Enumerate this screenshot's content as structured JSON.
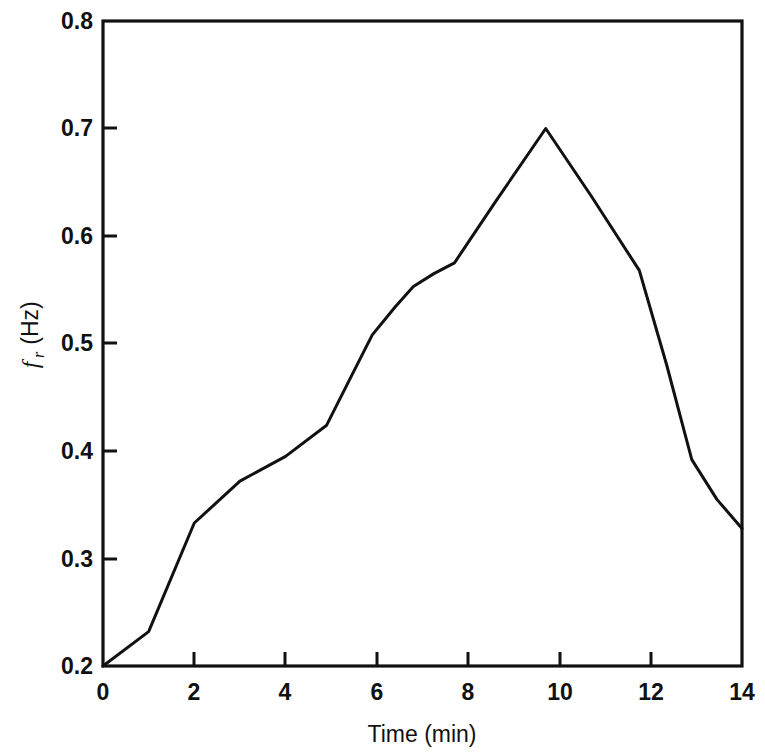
{
  "chart_data": {
    "type": "line",
    "title": "",
    "xlabel": "Time (min)",
    "ylabel": "f_r (Hz)",
    "ylabel_symbol": "f",
    "ylabel_subscript": "r",
    "ylabel_units": "(Hz)",
    "xlim": [
      0,
      14
    ],
    "ylim": [
      0.2,
      0.8
    ],
    "xticks": [
      0,
      2,
      4,
      6,
      8,
      10,
      12,
      14
    ],
    "xticklabels": [
      "0",
      "2",
      "4",
      "6",
      "8",
      "10",
      "12",
      "14"
    ],
    "yticks": [
      0.2,
      0.3,
      0.4,
      0.5,
      0.6,
      0.7,
      0.8
    ],
    "yticklabels": [
      "0.2",
      "0.3",
      "0.4",
      "0.5",
      "0.6",
      "0.7",
      "0.8"
    ],
    "grid": false,
    "legend": false,
    "legend_position": "none",
    "tick_direction": "in",
    "line_color": "#111111",
    "background_color": "#ffffff",
    "series": [
      {
        "name": "fr",
        "x": [
          0.0,
          1.0,
          2.0,
          3.0,
          4.0,
          4.9,
          5.35,
          5.9,
          6.4,
          6.8,
          7.25,
          7.7,
          8.6,
          9.7,
          10.7,
          11.75,
          12.35,
          12.9,
          13.45,
          14.0
        ],
        "y": [
          0.2,
          0.232,
          0.333,
          0.372,
          0.395,
          0.424,
          0.462,
          0.508,
          0.534,
          0.553,
          0.565,
          0.575,
          0.632,
          0.7,
          0.637,
          0.568,
          0.48,
          0.392,
          0.355,
          0.328
        ]
      }
    ],
    "annotations": [
      {
        "label": "peak",
        "x": 9.7,
        "y": 0.7
      },
      {
        "label": "start",
        "x": 0.0,
        "y": 0.2
      },
      {
        "label": "end",
        "x": 14.0,
        "y": 0.328
      }
    ]
  }
}
